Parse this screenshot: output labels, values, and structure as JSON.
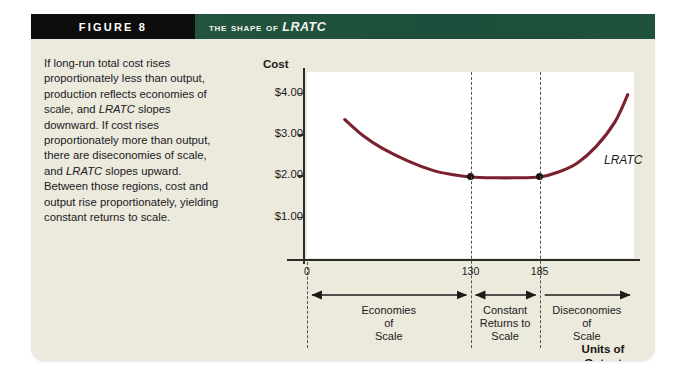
{
  "figure": {
    "number_label": "FIGURE 8",
    "title_prefix": "The Shape of ",
    "title_emphasis": "LRATC",
    "caption": "If long-run total cost rises proportionately less than output, production reflects economies of scale, and LRATC slopes downward. If cost rises proportionately more than output, there are diseconomies of scale, and LRATC slopes upward. Between those regions, cost and output rise proportionately, yielding constant returns to scale.",
    "caption_parts": {
      "p1": "If long-run total cost rises proportionately less than output, production reflects economies of scale, and ",
      "em1": "LRATC",
      "p2": " slopes downward. If cost rises proportionately more than output, there are diseconomies of scale, and ",
      "em2": "LRATC",
      "p3": " slopes upward. Between those regions, cost and output rise proportionately, yielding constant returns to scale."
    },
    "colors": {
      "panel_background": "#ece9dd",
      "header_black": "#0d0d0d",
      "header_green": "#1f5442",
      "curve": "#7a2230",
      "axis": "#2b2b28"
    }
  },
  "chart_data": {
    "type": "line",
    "title": "The Shape of LRATC",
    "xlabel": "Units of Output",
    "ylabel": "Cost",
    "y_axis_title": "Cost",
    "x_axis_title_line1": "Units of",
    "x_axis_title_line2": "Output",
    "ylim": [
      0,
      4.5
    ],
    "xlim": [
      0,
      260
    ],
    "y_tick_labels": [
      "$4.00",
      "$3.00",
      "$2.00",
      "$1.00"
    ],
    "y_tick_values": [
      4.0,
      3.0,
      2.0,
      1.0
    ],
    "x_tick_labels": [
      "0",
      "130",
      "185"
    ],
    "x_tick_values": [
      0,
      130,
      185
    ],
    "grid": false,
    "legend": "none",
    "series": [
      {
        "name": "LRATC",
        "label": "LRATC",
        "color": "#7a2230",
        "x": [
          30,
          45,
          60,
          80,
          100,
          115,
          130,
          150,
          165,
          185,
          200,
          215,
          230,
          245,
          255
        ],
        "y": [
          3.35,
          2.95,
          2.65,
          2.35,
          2.12,
          2.02,
          1.96,
          1.94,
          1.94,
          1.96,
          2.08,
          2.3,
          2.7,
          3.3,
          3.95
        ]
      }
    ],
    "points": [
      {
        "label": "minimum-left",
        "x": 130,
        "y": 1.96
      },
      {
        "label": "minimum-right",
        "x": 185,
        "y": 1.96
      }
    ],
    "annotations": [
      {
        "name": "curve-label",
        "text": "LRATC"
      }
    ],
    "regions": [
      {
        "name": "economies-of-scale",
        "lines": [
          "Economies",
          "of",
          "Scale"
        ],
        "from": 0,
        "to": 130,
        "arrow": "double"
      },
      {
        "name": "constant-returns-to-scale",
        "lines": [
          "Constant",
          "Returns to",
          "Scale"
        ],
        "from": 130,
        "to": 185,
        "arrow": "double"
      },
      {
        "name": "diseconomies-of-scale",
        "lines": [
          "Diseconomies",
          "of",
          "Scale"
        ],
        "from": 185,
        "to": 260,
        "arrow": "right"
      }
    ]
  }
}
